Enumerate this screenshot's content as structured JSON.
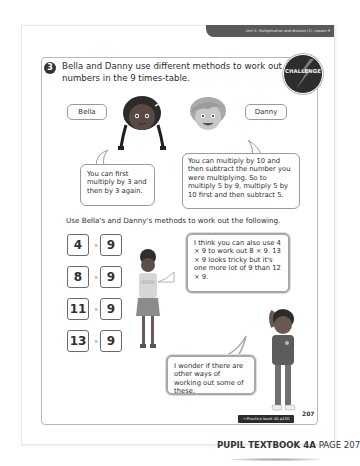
{
  "unit_header": "Unit 5: Multiplication and division (1), Lesson 9",
  "question": {
    "number": "3",
    "text": "Bella and Danny use different methods to work out numbers in the 9 times-table.",
    "badge": "CHALLENGE"
  },
  "characters": {
    "bella": {
      "name": "Bella",
      "speech": "You can first multiply by 3 and then by 3 again."
    },
    "danny": {
      "name": "Danny",
      "speech": "You can multiply by 10 and then subtract the number you were multiplying. So to multiply 5 by 9, multiply 5 by 10 first and then subtract 5."
    }
  },
  "instruction": "Use Bella's and Danny's methods to work out the following.",
  "calculations": [
    {
      "left": "4",
      "operator": "×",
      "right": "9"
    },
    {
      "left": "8",
      "operator": "×",
      "right": "9"
    },
    {
      "left": "11",
      "operator": "×",
      "right": "9"
    },
    {
      "left": "13",
      "operator": "×",
      "right": "9"
    }
  ],
  "hints": {
    "girl": "I think you can also use 4 × 9 to work out 8 × 9. 13 × 9 looks tricky but it's one more lot of 9 than 12 × 9.",
    "boy": "I wonder if there are other ways of working out some of these."
  },
  "practice_ref": "→ Practice book 4A p150",
  "page_number": "207",
  "footer": {
    "book": "PUPIL TEXTBOOK 4A",
    "page": "PAGE 207"
  }
}
